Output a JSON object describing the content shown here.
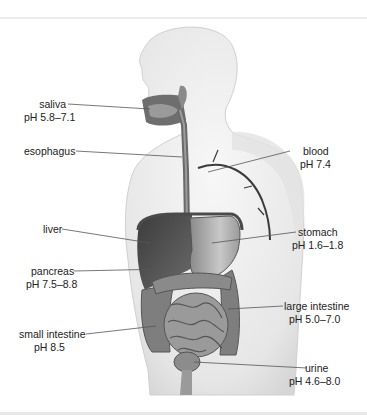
{
  "diagram": {
    "colors": {
      "body_fill": "#ececec",
      "organ_dark": "#4a4a4a",
      "organ_mid": "#8a8a8a",
      "leader_line": "#555555",
      "text": "#222222"
    },
    "labels": [
      {
        "id": "saliva",
        "name": "saliva",
        "ph": "pH 5.8–7.1"
      },
      {
        "id": "esophagus",
        "name": "esophagus",
        "ph": ""
      },
      {
        "id": "blood",
        "name": "blood",
        "ph": "pH 7.4"
      },
      {
        "id": "liver",
        "name": "liver",
        "ph": ""
      },
      {
        "id": "stomach",
        "name": "stomach",
        "ph": "pH 1.6–1.8"
      },
      {
        "id": "pancreas",
        "name": "pancreas",
        "ph": "pH 7.5–8.8"
      },
      {
        "id": "large-intestine",
        "name": "large intestine",
        "ph": "pH 5.0–7.0"
      },
      {
        "id": "small-intestine",
        "name": "small intestine",
        "ph": "pH 8.5"
      },
      {
        "id": "urine",
        "name": "urine",
        "ph": "pH 4.6–8.0"
      }
    ]
  }
}
